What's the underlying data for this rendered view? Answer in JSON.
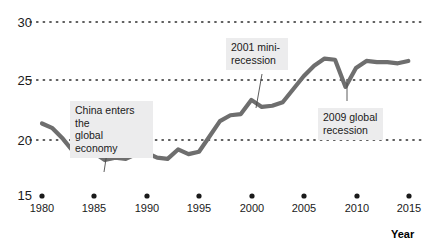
{
  "chart_data": {
    "type": "line",
    "title": "",
    "subtitle": "",
    "xlabel": "Year",
    "ylabel": "",
    "xlim": [
      1979,
      2016
    ],
    "ylim": [
      15,
      30
    ],
    "grid": "horizontal-dotted",
    "legend": "none",
    "y_ticks": [
      "30",
      "25",
      "20",
      "15"
    ],
    "y_tick_values": [
      30,
      25,
      20,
      15
    ],
    "x_ticks": [
      "1980",
      "1985",
      "1990",
      "1995",
      "2000",
      "2005",
      "2010",
      "2015"
    ],
    "x_tick_values": [
      1980,
      1985,
      1990,
      1995,
      2000,
      2005,
      2010,
      2015
    ],
    "series_name": "",
    "line_color": "#6e6e6e",
    "x": [
      1980,
      1981,
      1982,
      1983,
      1984,
      1985,
      1986,
      1987,
      1988,
      1989,
      1990,
      1991,
      1992,
      1993,
      1994,
      1995,
      1996,
      1997,
      1998,
      1999,
      2000,
      2001,
      2002,
      2003,
      2004,
      2005,
      2006,
      2007,
      2008,
      2009,
      2010,
      2011,
      2012,
      2013,
      2014,
      2015
    ],
    "values": [
      21.4,
      21.0,
      20.1,
      19.0,
      19.2,
      18.9,
      18.3,
      18.5,
      18.4,
      18.8,
      18.9,
      18.5,
      18.4,
      19.2,
      18.8,
      19.0,
      20.3,
      21.6,
      22.1,
      22.2,
      23.4,
      22.8,
      22.9,
      23.2,
      24.3,
      25.4,
      26.3,
      26.9,
      26.8,
      24.5,
      26.1,
      26.7,
      26.6,
      26.6,
      26.5,
      26.7
    ],
    "annotations": [
      {
        "id": "china-entry",
        "text": "China enters the\nglobal economy",
        "points_to_year": 1986,
        "points_to_value": 18.3
      },
      {
        "id": "mini-recession-2001",
        "text": "2001 mini-\nrecession",
        "points_to_year": 2001,
        "points_to_value": 22.8
      },
      {
        "id": "global-recession-2009",
        "text": "2009 global\nrecession",
        "points_to_year": 2009,
        "points_to_value": 24.5
      }
    ]
  },
  "axis": {
    "x_title": "Year"
  }
}
